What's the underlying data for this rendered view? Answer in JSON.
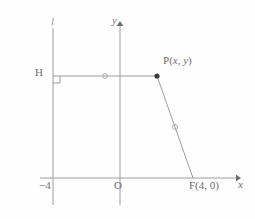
{
  "figure": {
    "type": "geometry-diagram",
    "width": 255,
    "height": 219,
    "background_color": "#fefefe",
    "stroke_color": "#9e9e9e",
    "text_color": "#6e6e6e"
  },
  "axes": {
    "x_axis": {
      "label": "x",
      "italic": true,
      "arrow": "right",
      "y_pixel": 178,
      "x_start_pixel": 40,
      "x_end_pixel": 240
    },
    "y_axis": {
      "label": "y",
      "italic": true,
      "arrow": "up",
      "x_pixel": 120,
      "y_start_pixel": 22,
      "y_end_pixel": 205
    },
    "origin_label": "O"
  },
  "directrix": {
    "name": "l",
    "label": "l",
    "italic": true,
    "x_pixel": 53,
    "x_value": -4,
    "x_tick_label": "−4",
    "y_start_pixel": 28,
    "y_end_pixel": 205
  },
  "points": [
    {
      "id": "H",
      "label": "H",
      "x_pixel": 53,
      "y_pixel": 76,
      "filled": false,
      "note": "foot of perpendicular on directrix"
    },
    {
      "id": "P",
      "label": "P(x, y)",
      "label_parts": {
        "name": "P",
        "open": "(",
        "x": "x",
        "sep": ", ",
        "y": "y",
        "close": ")"
      },
      "x_pixel": 157,
      "y_pixel": 76,
      "filled": true
    },
    {
      "id": "F",
      "label": "F(4, 0)",
      "label_parts": {
        "name": "F",
        "open": "(",
        "x": "4",
        "sep": ", ",
        "y": "0",
        "close": ")"
      },
      "x_pixel": 193,
      "y_pixel": 178,
      "x_value": 4,
      "y_value": 0,
      "filled": false
    }
  ],
  "segments": [
    {
      "id": "HP",
      "from": "H",
      "to": "P",
      "tick": "circle",
      "tick_x_pixel": 105,
      "tick_y_pixel": 76
    },
    {
      "id": "PF",
      "from": "P",
      "to": "F",
      "tick": "circle",
      "tick_x_pixel": 175,
      "tick_y_pixel": 127
    }
  ],
  "markers": {
    "right_angle_at_H": {
      "name": "right-angle-marker",
      "x_pixel": 53,
      "y_pixel": 76,
      "size": 7
    }
  }
}
